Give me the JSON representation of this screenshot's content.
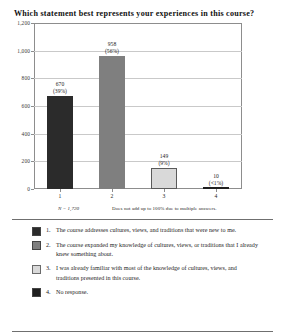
{
  "chart_data": {
    "type": "bar",
    "title": "Which statement best represents your experiences in this course?",
    "xlabel": "",
    "ylabel": "",
    "categories": [
      "1",
      "2",
      "3",
      "4"
    ],
    "values": [
      670,
      958,
      149,
      10
    ],
    "value_labels": [
      "670",
      "958",
      "149",
      "10"
    ],
    "percent_labels": [
      "(39%)",
      "(56%)",
      "(9%)",
      "(<1%)"
    ],
    "ylim": [
      0,
      1200
    ],
    "yticks": [
      0,
      200,
      400,
      600,
      800,
      1000,
      1200
    ],
    "ytick_labels": [
      "0",
      "200",
      "400",
      "600",
      "800",
      "1,000",
      "1,200"
    ],
    "grid": true,
    "legend_position": "below",
    "bar_colors": [
      "#2b2b2b",
      "#7f7f7f",
      "#d9d9d9",
      "#1f1f1f"
    ],
    "bar_border_color": "#5a5a5a"
  },
  "footnote": {
    "sample_size": "N = 1,720",
    "note": "Does not add up to 100% due to multiple answers."
  },
  "legend": {
    "items": [
      {
        "number": "1.",
        "label": "The course addresses cultures, views, and traditions that were new to me.",
        "color": "#2b2b2b"
      },
      {
        "number": "2.",
        "label": "The course expanded my knowledge of cultures, views, or traditions that I already knew something about.",
        "color": "#7f7f7f"
      },
      {
        "number": "3.",
        "label": "I was already familiar with most of the knowledge of cultures, views, and traditions presented in this course.",
        "color": "#d9d9d9"
      },
      {
        "number": "4.",
        "label": "No response.",
        "color": "#1f1f1f"
      }
    ]
  }
}
